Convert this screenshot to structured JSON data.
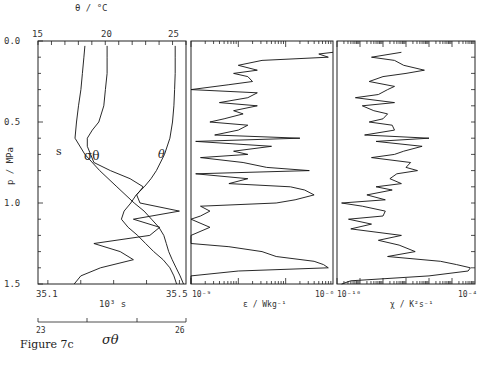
{
  "figure": {
    "caption": "Figure 7c"
  },
  "chart_data": [
    {
      "type": "line",
      "panel": "temperature-salinity-density",
      "ylabel": "p / MPa",
      "yticks": [
        "0.0",
        "0.5",
        "1.0",
        "1.5"
      ],
      "ylim": [
        0.0,
        1.5
      ],
      "y_inverted": true,
      "top_axis": {
        "label": "θ / °C",
        "ticks": [
          "15",
          "20",
          "25"
        ],
        "range": [
          15,
          26
        ]
      },
      "bottom_axis": {
        "label": "10³ s",
        "ticks": [
          "35.1",
          "35.5"
        ],
        "range": [
          35.07,
          35.52
        ]
      },
      "extra_axis": {
        "label": "σθ",
        "ticks": [
          "23",
          "26"
        ],
        "range": [
          23,
          26
        ]
      },
      "series": [
        {
          "name": "θ",
          "label": "θ",
          "p": [
            0.03,
            0.1,
            0.2,
            0.3,
            0.4,
            0.5,
            0.6,
            0.7,
            0.8,
            0.85,
            0.9,
            0.95,
            1.0,
            1.05,
            1.1,
            1.15,
            1.2,
            1.25,
            1.3,
            1.35,
            1.4,
            1.45,
            1.5
          ],
          "values": [
            25.2,
            25.2,
            25.2,
            25.15,
            25.1,
            25.0,
            24.8,
            24.4,
            23.8,
            23.4,
            22.9,
            22.3,
            21.9,
            21.4,
            21.2,
            21.7,
            22.4,
            23.0,
            23.6,
            24.3,
            24.8,
            25.1,
            25.3
          ]
        },
        {
          "name": "σθ",
          "label": "σθ",
          "p": [
            0.03,
            0.1,
            0.2,
            0.3,
            0.4,
            0.5,
            0.6,
            0.7,
            0.8,
            0.9,
            1.0,
            1.05,
            1.1,
            1.15,
            1.2,
            1.25,
            1.3,
            1.35,
            1.4,
            1.45,
            1.5
          ],
          "values": [
            23.95,
            23.93,
            23.9,
            23.87,
            23.82,
            23.78,
            23.75,
            23.95,
            24.25,
            24.6,
            24.95,
            25.15,
            25.3,
            25.45,
            25.55,
            25.6,
            25.65,
            25.72,
            25.8,
            25.88,
            25.95
          ]
        },
        {
          "name": "s",
          "label": "s",
          "p": [
            0.03,
            0.1,
            0.2,
            0.3,
            0.4,
            0.5,
            0.55,
            0.6,
            0.65,
            0.7,
            0.75,
            0.8,
            0.85,
            0.9,
            0.95,
            1.0,
            1.05,
            1.1,
            1.15,
            1.2,
            1.25,
            1.3,
            1.35,
            1.4,
            1.45,
            1.5
          ],
          "values": [
            35.28,
            35.28,
            35.28,
            35.275,
            35.27,
            35.255,
            35.235,
            35.22,
            35.22,
            35.23,
            35.24,
            35.29,
            35.35,
            35.39,
            35.37,
            35.38,
            35.5,
            35.36,
            35.44,
            35.41,
            35.24,
            35.32,
            35.36,
            35.26,
            35.2,
            35.18
          ]
        }
      ]
    },
    {
      "type": "line",
      "panel": "dissipation-rate",
      "xlabel": "ε / Wkg⁻¹",
      "xscale": "log",
      "xticks": [
        "10⁻⁹",
        "10⁻⁶"
      ],
      "xlim": [
        1e-09,
        1e-06
      ],
      "ylim": [
        0.0,
        1.5
      ],
      "y_inverted": true,
      "series": [
        {
          "name": "epsilon",
          "p": [
            0.07,
            0.08,
            0.1,
            0.12,
            0.15,
            0.18,
            0.2,
            0.22,
            0.25,
            0.27,
            0.3,
            0.32,
            0.35,
            0.38,
            0.4,
            0.43,
            0.45,
            0.48,
            0.5,
            0.52,
            0.55,
            0.58,
            0.6,
            0.62,
            0.65,
            0.68,
            0.7,
            0.72,
            0.75,
            0.78,
            0.8,
            0.82,
            0.85,
            0.88,
            0.9,
            0.92,
            0.95,
            0.98,
            1.0,
            1.02,
            1.05,
            1.08,
            1.1,
            1.15,
            1.2,
            1.25,
            1.27,
            1.3,
            1.33,
            1.36,
            1.38,
            1.4,
            1.42,
            1.45,
            1.5
          ],
          "log10_values": [
            -6.0,
            -6.3,
            -6.1,
            -7.5,
            -8.0,
            -7.6,
            -8.1,
            -7.8,
            -7.7,
            -8.2,
            -9.0,
            -7.6,
            -7.8,
            -8.4,
            -7.6,
            -8.1,
            -7.9,
            -8.3,
            -8.6,
            -7.8,
            -8.0,
            -8.5,
            -6.7,
            -8.9,
            -7.3,
            -8.1,
            -7.8,
            -8.8,
            -7.9,
            -7.4,
            -6.5,
            -8.9,
            -7.8,
            -8.2,
            -6.9,
            -6.6,
            -6.4,
            -6.8,
            -7.2,
            -8.8,
            -8.6,
            -8.8,
            -9.0,
            -8.6,
            -9.0,
            -9.0,
            -8.2,
            -7.5,
            -7.2,
            -6.4,
            -6.2,
            -6.1,
            -8.0,
            -9.0,
            -9.0
          ]
        }
      ]
    },
    {
      "type": "line",
      "panel": "thermal-variance-dissipation",
      "xlabel": "χ / K²s⁻¹",
      "xscale": "log",
      "xticks": [
        "10⁻¹⁰",
        "10⁻⁴"
      ],
      "xlim": [
        1e-10,
        0.0001
      ],
      "ylim": [
        0.0,
        1.5
      ],
      "y_inverted": true,
      "series": [
        {
          "name": "chi",
          "p": [
            0.07,
            0.1,
            0.12,
            0.15,
            0.18,
            0.2,
            0.22,
            0.25,
            0.28,
            0.3,
            0.33,
            0.35,
            0.38,
            0.4,
            0.43,
            0.45,
            0.48,
            0.5,
            0.52,
            0.55,
            0.58,
            0.6,
            0.62,
            0.65,
            0.68,
            0.7,
            0.72,
            0.75,
            0.78,
            0.8,
            0.82,
            0.85,
            0.88,
            0.9,
            0.92,
            0.95,
            0.98,
            1.0,
            1.02,
            1.05,
            1.08,
            1.1,
            1.13,
            1.16,
            1.2,
            1.23,
            1.26,
            1.3,
            1.33,
            1.36,
            1.38,
            1.4,
            1.42,
            1.45,
            1.48,
            1.5
          ],
          "log10_values": [
            -7.2,
            -8.5,
            -7.5,
            -7.1,
            -6.2,
            -7.0,
            -8.0,
            -8.6,
            -7.5,
            -7.8,
            -8.2,
            -9.2,
            -7.5,
            -8.9,
            -8.4,
            -7.8,
            -8.0,
            -8.6,
            -7.6,
            -7.5,
            -8.8,
            -6.0,
            -8.3,
            -6.3,
            -7.1,
            -7.5,
            -8.5,
            -6.8,
            -7.0,
            -6.5,
            -7.4,
            -7.7,
            -7.2,
            -8.3,
            -7.6,
            -8.7,
            -7.9,
            -9.8,
            -8.9,
            -7.9,
            -8.0,
            -9.5,
            -8.5,
            -9.4,
            -7.2,
            -8.2,
            -7.3,
            -6.6,
            -7.8,
            -5.5,
            -4.8,
            -4.2,
            -4.3,
            -6.0,
            -9.4,
            -9.8
          ]
        }
      ]
    }
  ]
}
